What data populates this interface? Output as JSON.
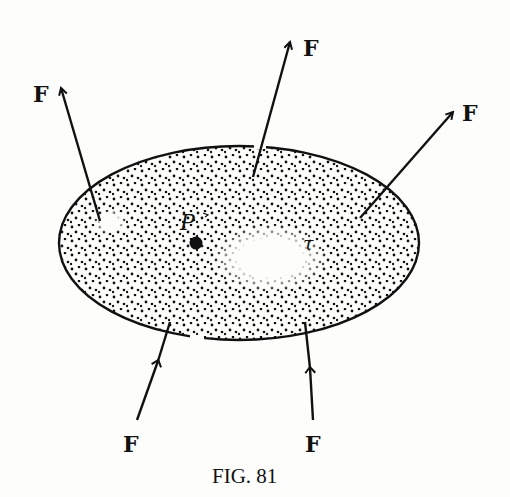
{
  "figure": {
    "caption": "Fig. 81",
    "caption_display": "FIG. 81",
    "region_label": "τ",
    "point_label": "P",
    "force_label": "F",
    "colors": {
      "ink": "#111111",
      "paper": "#fdfdfb"
    },
    "forces": [
      {
        "id": "top",
        "label": "F"
      },
      {
        "id": "upper-left",
        "label": "F"
      },
      {
        "id": "upper-right",
        "label": "F"
      },
      {
        "id": "lower-left",
        "label": "F"
      },
      {
        "id": "lower-right",
        "label": "F"
      }
    ]
  }
}
